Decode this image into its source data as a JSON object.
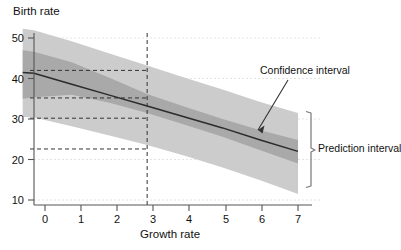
{
  "chart_data": {
    "type": "line",
    "title": "",
    "xlabel": "Growth rate",
    "ylabel": "Birth rate",
    "xlim": [
      -0.35,
      7.15
    ],
    "ylim": [
      8.5,
      53
    ],
    "xticks": [
      0,
      1,
      2,
      3,
      4,
      5,
      6,
      7
    ],
    "xtick_labels": [
      "0",
      "1",
      "2",
      "3",
      "4",
      "5",
      "6",
      "7"
    ],
    "yticks": [
      10,
      20,
      30,
      40,
      50
    ],
    "ytick_labels": [
      "10",
      "20",
      "30",
      "40",
      "50"
    ],
    "grid": false,
    "legend_position": "annotations",
    "series": [
      {
        "name": "Fitted regression line",
        "type": "line",
        "color": "#2b2b2b",
        "x": [
          -0.3,
          0,
          1,
          2,
          3,
          4,
          5,
          6,
          7
        ],
        "values": [
          41.5,
          41.3,
          38.6,
          35.9,
          33.2,
          30.5,
          27.8,
          24.8,
          22.0
        ]
      },
      {
        "name": "Confidence interval",
        "type": "band",
        "color": "#a9a9a9",
        "x": [
          -0.3,
          0,
          1,
          2,
          3,
          4,
          5,
          6,
          7
        ],
        "lower": [
          35.0,
          35.4,
          36.0,
          34.0,
          31.5,
          28.6,
          25.6,
          22.3,
          19.0
        ],
        "upper": [
          47.0,
          46.6,
          44.0,
          40.2,
          36.2,
          33.0,
          30.0,
          27.2,
          24.8
        ]
      },
      {
        "name": "Prediction interval",
        "type": "band",
        "color": "#cccccc",
        "x": [
          -0.3,
          0,
          1,
          2,
          3,
          4,
          5,
          6,
          7
        ],
        "lower": [
          30.5,
          30.4,
          28.2,
          25.9,
          23.6,
          20.9,
          18.0,
          14.9,
          11.5
        ],
        "upper": [
          52.3,
          51.9,
          49.2,
          46.2,
          43.2,
          40.2,
          37.3,
          34.2,
          31.5
        ]
      }
    ],
    "reference_lines": {
      "vertical": [
        {
          "x": 3,
          "style": "dashed",
          "color": "#333333"
        }
      ],
      "horizontal": [
        {
          "y": 42.0,
          "style": "dashed",
          "color": "#333333",
          "x_from": -0.35,
          "x_to": 3
        },
        {
          "y": 35.2,
          "style": "dashed",
          "color": "#333333",
          "x_from": -0.35,
          "x_to": 3
        },
        {
          "y": 30.2,
          "style": "dashed",
          "color": "#333333",
          "x_from": -0.35,
          "x_to": 3
        },
        {
          "y": 22.6,
          "style": "dashed",
          "color": "#333333",
          "x_from": -0.35,
          "x_to": 3
        }
      ]
    },
    "annotations": [
      {
        "name": "confidence-interval",
        "text": "Confidence interval",
        "x": 5.9,
        "y": 26.5,
        "arrow": true
      },
      {
        "name": "prediction-interval",
        "text": "Prediction interval",
        "x": 7.35,
        "y": 21.5,
        "arrow": false,
        "bracket": {
          "y_top": 31.5,
          "y_bottom": 11.5
        }
      }
    ]
  },
  "axes": {
    "x_label": "Growth rate",
    "y_label": "Birth rate",
    "x_tick_labels": [
      "0",
      "1",
      "2",
      "3",
      "4",
      "5",
      "6",
      "7"
    ],
    "y_tick_labels": [
      "10",
      "20",
      "30",
      "40",
      "50"
    ]
  },
  "labels": {
    "confidence_interval": "Confidence interval",
    "prediction_interval": "Prediction interval"
  },
  "colors": {
    "prediction_band": "#cccccc",
    "confidence_band": "#a9a9a9",
    "line": "#2b2b2b",
    "axis": "#555555",
    "dashed": "#333333",
    "background": "#ffffff"
  }
}
